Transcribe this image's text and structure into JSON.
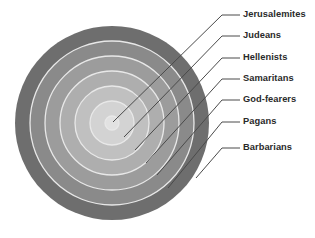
{
  "diagram": {
    "type": "concentric-rings",
    "title": "",
    "background_color": "#ffffff",
    "center": {
      "x": 112,
      "y": 123
    },
    "outer_radius": 97,
    "ring_separator_color": "#e8e8e8",
    "leader_line_color": "#4a4a4a",
    "label_color": "#2a2a2a",
    "rings": [
      {
        "index": 1,
        "label": "Jerusalemites",
        "position": "innermost",
        "radius": 7,
        "color": "#e2e2e2",
        "label_x": 243,
        "label_y": 15,
        "tick_x1": 222,
        "tick_x2": 240,
        "anchor_x": 113,
        "anchor_y": 122
      },
      {
        "index": 2,
        "label": "Judeans",
        "radius": 22,
        "color": "#d3d3d3",
        "label_x": 243,
        "label_y": 36,
        "tick_x1": 222,
        "tick_x2": 240,
        "anchor_x": 124,
        "anchor_y": 137
      },
      {
        "index": 3,
        "label": "Hellenists",
        "radius": 37,
        "color": "#c0c0c0",
        "label_x": 243,
        "label_y": 58,
        "tick_x1": 222,
        "tick_x2": 240,
        "anchor_x": 135,
        "anchor_y": 150
      },
      {
        "index": 4,
        "label": "Samaritans",
        "radius": 52,
        "color": "#aeaeae",
        "label_x": 243,
        "label_y": 79,
        "tick_x1": 222,
        "tick_x2": 240,
        "anchor_x": 146,
        "anchor_y": 163
      },
      {
        "index": 5,
        "label": "God-fearers",
        "radius": 67,
        "color": "#9c9c9c",
        "label_x": 243,
        "label_y": 100,
        "tick_x1": 222,
        "tick_x2": 240,
        "anchor_x": 157,
        "anchor_y": 175
      },
      {
        "index": 6,
        "label": "Pagans",
        "radius": 82,
        "color": "#8a8a8a",
        "label_x": 243,
        "label_y": 122,
        "tick_x1": 222,
        "tick_x2": 240,
        "anchor_x": 168,
        "anchor_y": 188
      },
      {
        "index": 7,
        "label": "Barbarians",
        "position": "outermost",
        "radius": 97,
        "color": "#6e6e6e",
        "label_x": 243,
        "label_y": 148,
        "tick_x1": 222,
        "tick_x2": 240,
        "anchor_x": 196,
        "anchor_y": 178
      }
    ]
  }
}
